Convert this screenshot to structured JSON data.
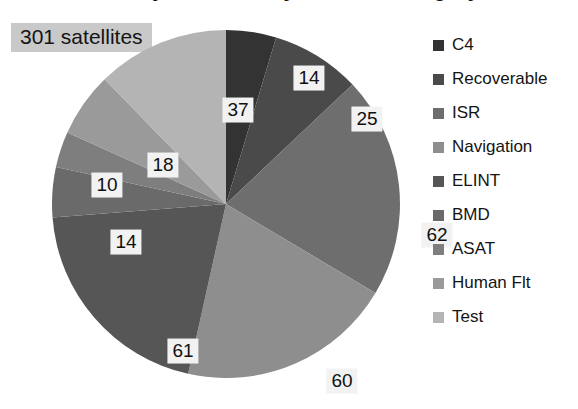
{
  "chart_data": {
    "type": "pie",
    "title": "Chinese Military Satellites by Mission Category",
    "categories": [
      "C4",
      "Recoverable",
      "ISR",
      "Navigation",
      "ELINT",
      "BMD",
      "ASAT",
      "Human Flt",
      "Test"
    ],
    "values": [
      14,
      25,
      62,
      60,
      61,
      14,
      10,
      18,
      37
    ],
    "total": 301,
    "annotation": "301 satellites",
    "xlabel": "",
    "ylabel": "",
    "grid": false,
    "legend_position": "right",
    "data_labels_shown": true,
    "slice_colors": [
      "#333333",
      "#4a4a4a",
      "#6e6e6e",
      "#8e8e8e",
      "#565656",
      "#6a6a6a",
      "#7e7e7e",
      "#9a9a9a",
      "#b4b4b4"
    ],
    "slices": [
      {
        "label": "C4",
        "value": 14,
        "color": "#333333",
        "label_x": 257,
        "label_y": 48
      },
      {
        "label": "Recoverable",
        "value": 25,
        "color": "#4a4a4a",
        "label_x": 315,
        "label_y": 89
      },
      {
        "label": "ISR",
        "value": 62,
        "color": "#6e6e6e",
        "label_x": 385,
        "label_y": 205
      },
      {
        "label": "Navigation",
        "value": 60,
        "color": "#8e8e8e",
        "label_x": 290,
        "label_y": 351
      },
      {
        "label": "ELINT",
        "value": 61,
        "color": "#565656",
        "label_x": 131,
        "label_y": 321
      },
      {
        "label": "BMD",
        "value": 14,
        "color": "#6a6a6a",
        "label_x": 74,
        "label_y": 212
      },
      {
        "label": "ASAT",
        "value": 10,
        "color": "#7e7e7e",
        "label_x": 55,
        "label_y": 155
      },
      {
        "label": "Human Flt",
        "value": 18,
        "color": "#9a9a9a",
        "label_x": 111,
        "label_y": 135
      },
      {
        "label": "Test",
        "value": 37,
        "color": "#b4b4b4",
        "label_x": 186,
        "label_y": 80
      }
    ]
  },
  "legend": {
    "items": [
      {
        "label": "C4",
        "color": "#333333"
      },
      {
        "label": "Recoverable",
        "color": "#4a4a4a"
      },
      {
        "label": "ISR",
        "color": "#6e6e6e"
      },
      {
        "label": "Navigation",
        "color": "#8e8e8e"
      },
      {
        "label": "ELINT",
        "color": "#565656"
      },
      {
        "label": "BMD",
        "color": "#6a6a6a"
      },
      {
        "label": "ASAT",
        "color": "#7e7e7e"
      },
      {
        "label": "Human Flt",
        "color": "#9a9a9a"
      },
      {
        "label": "Test",
        "color": "#b4b4b4"
      }
    ]
  },
  "colors": {
    "background": "#ffffff",
    "label_box": "#f2f2f2",
    "annotation_box": "#c9c9c9",
    "text": "#141414"
  }
}
